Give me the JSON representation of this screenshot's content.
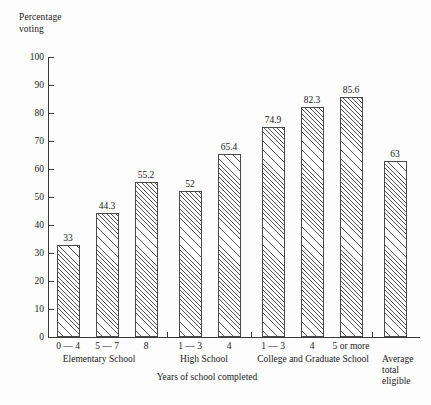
{
  "chart_data": {
    "type": "bar",
    "title": "",
    "ylabel": "Percentage voting",
    "xlabel": "Years of school completed",
    "ylim": [
      0,
      100
    ],
    "ytick_labels": [
      "100",
      "90",
      "80",
      "70",
      "60",
      "50",
      "40",
      "30",
      "20",
      "10",
      "0"
    ],
    "yticks": [
      100,
      90,
      80,
      70,
      60,
      50,
      40,
      30,
      20,
      10,
      0
    ],
    "grid": false,
    "legend": "none",
    "categories": [
      "0 — 4",
      "5 — 7",
      "8",
      "1 — 3",
      "4",
      "1 — 3",
      "4",
      "5 or more",
      "Average total eligible"
    ],
    "values": [
      33,
      44.3,
      55.2,
      52,
      65.4,
      74.9,
      82.3,
      85.6,
      63
    ],
    "value_labels": [
      "33",
      "44.3",
      "55.2",
      "52",
      "65.4",
      "74.9",
      "82.3",
      "85.6",
      "63"
    ],
    "groups": [
      {
        "label": "Elementary School",
        "members": [
          "0 — 4",
          "5 — 7",
          "8"
        ]
      },
      {
        "label": "High School",
        "members": [
          "1 — 3",
          "4"
        ]
      },
      {
        "label": "College and Graduate School",
        "members": [
          "1 — 3",
          "4",
          "5 or more"
        ]
      },
      {
        "label": "Average total eligible",
        "members": [
          "Average total eligible"
        ]
      }
    ]
  },
  "axis": {
    "y_title_line1": "Percentage",
    "y_title_line2": "voting",
    "x_title": "Years of school completed"
  },
  "group_labels": {
    "elementary": "Elementary School",
    "high_school": "High School",
    "college": "College and Graduate School",
    "average_line1": "Average",
    "average_line2": "total",
    "average_line3": "eligible"
  }
}
